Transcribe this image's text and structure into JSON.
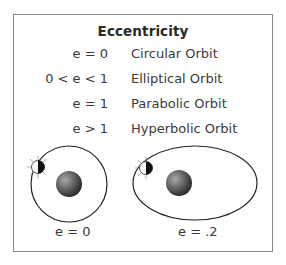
{
  "title": "Eccentricity",
  "rows": [
    {
      "condition": "e = 0",
      "orbit": "Circular Orbit"
    },
    {
      "condition": "0 < e < 1",
      "orbit": "Elliptical Orbit"
    },
    {
      "condition": "e = 1",
      "orbit": "Parabolic Orbit"
    },
    {
      "condition": "e > 1",
      "orbit": "Hyperbolic Orbit"
    }
  ],
  "diagrams": [
    {
      "shape": "circle",
      "caption": "e = 0"
    },
    {
      "shape": "ellipse",
      "caption": "e = .2"
    }
  ],
  "colors": {
    "border": "#8a8a8a",
    "text": "#3a3a3a",
    "orbit": "#222222",
    "planet_dark": "#2b2b2b",
    "planet_light": "#9a9a9a"
  }
}
